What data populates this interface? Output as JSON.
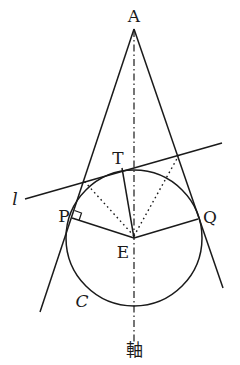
{
  "figure": {
    "type": "geometry diagram",
    "labels": {
      "apex": "A",
      "tangent_point_line": "T",
      "left_tangent_point": "P",
      "right_tangent_point": "Q",
      "center": "E",
      "circle": "C",
      "line": "l",
      "axis": "軸"
    },
    "right_angle_marker_at": "P",
    "stroke_color": "#1a1a1a",
    "background_color": "#ffffff"
  }
}
